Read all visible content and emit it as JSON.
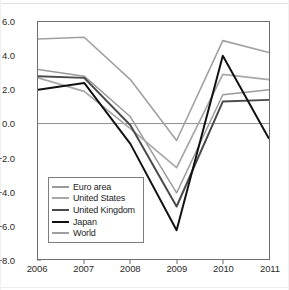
{
  "chart_data": {
    "type": "line",
    "title": "",
    "subtitle": "",
    "xlabel": "",
    "ylabel": "",
    "x": [
      "2006",
      "2007",
      "2008",
      "2009",
      "2010",
      "2011"
    ],
    "categories": [
      "2006",
      "2007",
      "2008",
      "2009",
      "2010",
      "2011"
    ],
    "xlim": [
      2006,
      2011
    ],
    "ylim": [
      -8.0,
      6.0
    ],
    "yticks": [
      "6.0",
      "4.0",
      "2.0",
      "0.0",
      "-2.0",
      "-4.0",
      "-6.0",
      "-8.0"
    ],
    "ytick_values": [
      6.0,
      4.0,
      2.0,
      0.0,
      -2.0,
      -4.0,
      -6.0,
      -8.0
    ],
    "grid": false,
    "zero_line": true,
    "legend_position": "lower-left-inside",
    "series": [
      {
        "name": "Euro area",
        "color": "#9a9a9a",
        "width": 1.5,
        "values": [
          3.2,
          2.8,
          0.4,
          -4.1,
          1.7,
          2.0
        ]
      },
      {
        "name": "United States",
        "color": "#a8a8a8",
        "width": 1.8,
        "values": [
          2.7,
          1.9,
          -0.3,
          -2.6,
          2.9,
          2.6
        ]
      },
      {
        "name": "United Kingdom",
        "color": "#4a4a4a",
        "width": 2.0,
        "values": [
          2.8,
          2.7,
          -0.1,
          -4.9,
          1.3,
          1.4
        ]
      },
      {
        "name": "Japan",
        "color": "#111111",
        "width": 2.0,
        "values": [
          2.0,
          2.4,
          -1.2,
          -6.3,
          4.0,
          -0.9
        ]
      },
      {
        "name": "World",
        "color": "#a0a0a0",
        "width": 1.6,
        "values": [
          5.0,
          5.1,
          2.6,
          -1.0,
          4.9,
          4.2
        ]
      }
    ]
  },
  "axes": {
    "zero_line_color": "#8d8d8d",
    "frame_color": "#6e6e6e",
    "tick_text_color": "#2b2b2b"
  },
  "legend": {
    "entries": [
      {
        "label": "Euro area"
      },
      {
        "label": "United States"
      },
      {
        "label": "United Kingdom"
      },
      {
        "label": "Japan"
      },
      {
        "label": "World"
      }
    ]
  }
}
